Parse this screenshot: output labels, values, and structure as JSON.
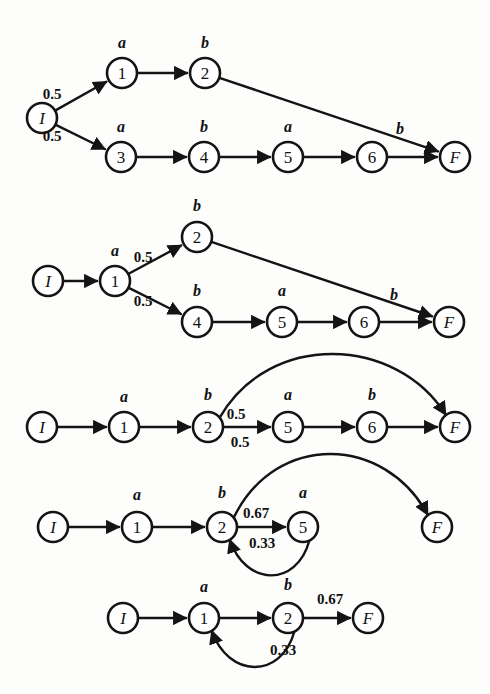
{
  "figure": {
    "background_color": "#fdfdfc",
    "ink_color": "#141414",
    "node_radius": 15,
    "diagrams": [
      {
        "id": "diagram-1",
        "nodes": [
          {
            "id": "I",
            "label": "I",
            "italic": true,
            "x": 42,
            "y": 118
          },
          {
            "id": "n1",
            "label": "1",
            "italic": false,
            "x": 122,
            "y": 73
          },
          {
            "id": "n2",
            "label": "2",
            "italic": false,
            "x": 205,
            "y": 73
          },
          {
            "id": "n3",
            "label": "3",
            "italic": false,
            "x": 121,
            "y": 157
          },
          {
            "id": "n4",
            "label": "4",
            "italic": false,
            "x": 204,
            "y": 157
          },
          {
            "id": "n5",
            "label": "5",
            "italic": false,
            "x": 288,
            "y": 157
          },
          {
            "id": "n6",
            "label": "6",
            "italic": false,
            "x": 372,
            "y": 157
          },
          {
            "id": "F",
            "label": "F",
            "italic": true,
            "x": 455,
            "y": 157
          }
        ],
        "edges": [
          {
            "from": "I",
            "to": "n1",
            "kind": "line"
          },
          {
            "from": "I",
            "to": "n3",
            "kind": "line"
          },
          {
            "from": "n1",
            "to": "n2",
            "kind": "line"
          },
          {
            "from": "n2",
            "to": "F",
            "kind": "line"
          },
          {
            "from": "n3",
            "to": "n4",
            "kind": "line"
          },
          {
            "from": "n4",
            "to": "n5",
            "kind": "line"
          },
          {
            "from": "n5",
            "to": "n6",
            "kind": "line"
          },
          {
            "from": "n6",
            "to": "F",
            "kind": "line"
          }
        ],
        "symbol_labels": [
          {
            "text": "a",
            "x": 122,
            "y": 48
          },
          {
            "text": "b",
            "x": 205,
            "y": 48
          },
          {
            "text": "a",
            "x": 121,
            "y": 132
          },
          {
            "text": "b",
            "x": 204,
            "y": 132
          },
          {
            "text": "a",
            "x": 288,
            "y": 132
          },
          {
            "text": "b",
            "x": 400,
            "y": 134
          }
        ],
        "prob_labels": [
          {
            "text": "0.5",
            "x": 52,
            "y": 99
          },
          {
            "text": "0.5",
            "x": 52,
            "y": 141
          }
        ]
      },
      {
        "id": "diagram-2",
        "nodes": [
          {
            "id": "I",
            "label": "I",
            "italic": true,
            "x": 48,
            "y": 281
          },
          {
            "id": "n1",
            "label": "1",
            "italic": false,
            "x": 115,
            "y": 281
          },
          {
            "id": "n2",
            "label": "2",
            "italic": false,
            "x": 197,
            "y": 237
          },
          {
            "id": "n4",
            "label": "4",
            "italic": false,
            "x": 197,
            "y": 322
          },
          {
            "id": "n5",
            "label": "5",
            "italic": false,
            "x": 282,
            "y": 322
          },
          {
            "id": "n6",
            "label": "6",
            "italic": false,
            "x": 364,
            "y": 322
          },
          {
            "id": "F",
            "label": "F",
            "italic": true,
            "x": 449,
            "y": 322
          }
        ],
        "edges": [
          {
            "from": "I",
            "to": "n1",
            "kind": "line"
          },
          {
            "from": "n1",
            "to": "n2",
            "kind": "line"
          },
          {
            "from": "n1",
            "to": "n4",
            "kind": "line"
          },
          {
            "from": "n2",
            "to": "F",
            "kind": "line"
          },
          {
            "from": "n4",
            "to": "n5",
            "kind": "line"
          },
          {
            "from": "n5",
            "to": "n6",
            "kind": "line"
          },
          {
            "from": "n6",
            "to": "F",
            "kind": "line"
          }
        ],
        "symbol_labels": [
          {
            "text": "a",
            "x": 115,
            "y": 256
          },
          {
            "text": "b",
            "x": 197,
            "y": 211
          },
          {
            "text": "b",
            "x": 197,
            "y": 296
          },
          {
            "text": "a",
            "x": 282,
            "y": 296
          },
          {
            "text": "b",
            "x": 394,
            "y": 300
          }
        ],
        "prob_labels": [
          {
            "text": "0.5",
            "x": 143,
            "y": 262
          },
          {
            "text": "0.5",
            "x": 143,
            "y": 306
          }
        ]
      },
      {
        "id": "diagram-3",
        "nodes": [
          {
            "id": "I",
            "label": "I",
            "italic": true,
            "x": 42,
            "y": 427
          },
          {
            "id": "n1",
            "label": "1",
            "italic": false,
            "x": 124,
            "y": 427
          },
          {
            "id": "n2",
            "label": "2",
            "italic": false,
            "x": 208,
            "y": 427
          },
          {
            "id": "n5",
            "label": "5",
            "italic": false,
            "x": 288,
            "y": 427
          },
          {
            "id": "n6",
            "label": "6",
            "italic": false,
            "x": 372,
            "y": 427
          },
          {
            "id": "F",
            "label": "F",
            "italic": true,
            "x": 455,
            "y": 427
          }
        ],
        "edges": [
          {
            "from": "I",
            "to": "n1",
            "kind": "line"
          },
          {
            "from": "n1",
            "to": "n2",
            "kind": "line"
          },
          {
            "from": "n2",
            "to": "n5",
            "kind": "line"
          },
          {
            "from": "n5",
            "to": "n6",
            "kind": "line"
          },
          {
            "from": "n6",
            "to": "F",
            "kind": "line"
          },
          {
            "from": "n2",
            "to": "F",
            "kind": "arc-over"
          }
        ],
        "symbol_labels": [
          {
            "text": "a",
            "x": 124,
            "y": 402
          },
          {
            "text": "b",
            "x": 208,
            "y": 400
          },
          {
            "text": "a",
            "x": 288,
            "y": 400
          },
          {
            "text": "b",
            "x": 372,
            "y": 400
          }
        ],
        "prob_labels": [
          {
            "text": "0.5",
            "x": 236,
            "y": 419
          },
          {
            "text": "0.5",
            "x": 240,
            "y": 447
          }
        ]
      },
      {
        "id": "diagram-4",
        "nodes": [
          {
            "id": "I",
            "label": "I",
            "italic": true,
            "x": 53,
            "y": 527
          },
          {
            "id": "n1",
            "label": "1",
            "italic": false,
            "x": 137,
            "y": 527
          },
          {
            "id": "n2",
            "label": "2",
            "italic": false,
            "x": 222,
            "y": 527
          },
          {
            "id": "n5",
            "label": "5",
            "italic": false,
            "x": 303,
            "y": 527
          },
          {
            "id": "F",
            "label": "F",
            "italic": true,
            "x": 437,
            "y": 527
          }
        ],
        "edges": [
          {
            "from": "I",
            "to": "n1",
            "kind": "line"
          },
          {
            "from": "n1",
            "to": "n2",
            "kind": "line"
          },
          {
            "from": "n2",
            "to": "n5",
            "kind": "line"
          },
          {
            "from": "n2",
            "to": "F",
            "kind": "arc-over"
          },
          {
            "from": "n5",
            "to": "n2",
            "kind": "arc-under"
          }
        ],
        "symbol_labels": [
          {
            "text": "a",
            "x": 137,
            "y": 500
          },
          {
            "text": "b",
            "x": 222,
            "y": 498
          },
          {
            "text": "a",
            "x": 303,
            "y": 498
          }
        ],
        "prob_labels": [
          {
            "text": "0.67",
            "x": 256,
            "y": 518
          },
          {
            "text": "0.33",
            "x": 262,
            "y": 548
          }
        ]
      },
      {
        "id": "diagram-5",
        "nodes": [
          {
            "id": "I",
            "label": "I",
            "italic": true,
            "x": 123,
            "y": 618
          },
          {
            "id": "n1",
            "label": "1",
            "italic": false,
            "x": 204,
            "y": 618
          },
          {
            "id": "n2",
            "label": "2",
            "italic": false,
            "x": 288,
            "y": 618
          },
          {
            "id": "F",
            "label": "F",
            "italic": true,
            "x": 368,
            "y": 618
          }
        ],
        "edges": [
          {
            "from": "I",
            "to": "n1",
            "kind": "line"
          },
          {
            "from": "n1",
            "to": "n2",
            "kind": "line"
          },
          {
            "from": "n2",
            "to": "F",
            "kind": "line"
          },
          {
            "from": "n2",
            "to": "n1",
            "kind": "arc-under"
          }
        ],
        "symbol_labels": [
          {
            "text": "a",
            "x": 204,
            "y": 592
          },
          {
            "text": "b",
            "x": 288,
            "y": 590
          }
        ],
        "prob_labels": [
          {
            "text": "0.67",
            "x": 330,
            "y": 604
          },
          {
            "text": "0.33",
            "x": 283,
            "y": 655
          }
        ]
      }
    ]
  }
}
